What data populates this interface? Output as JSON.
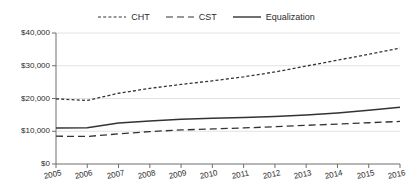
{
  "chart_data": {
    "type": "line",
    "title": "",
    "xlabel": "",
    "ylabel": "",
    "categories": [
      "2005",
      "2006",
      "2007",
      "2008",
      "2009",
      "2010",
      "2011",
      "2012",
      "2013",
      "2014",
      "2015",
      "2016"
    ],
    "ylim": [
      0,
      40000
    ],
    "ytick_values": [
      0,
      10000,
      20000,
      30000,
      40000
    ],
    "ytick_labels": [
      "$0",
      "$10,000",
      "$20,000",
      "$30,000",
      "$40,000"
    ],
    "grid": true,
    "legend_position": "top-center",
    "series": [
      {
        "name": "CHT",
        "style": "dotted",
        "color": "#333333",
        "values": [
          19900,
          19400,
          21600,
          23100,
          24300,
          25400,
          26600,
          28100,
          29900,
          31700,
          33500,
          35400
        ]
      },
      {
        "name": "CST",
        "style": "dashed",
        "color": "#333333",
        "values": [
          8500,
          8400,
          9200,
          9900,
          10400,
          10700,
          11000,
          11400,
          11800,
          12200,
          12600,
          13000
        ]
      },
      {
        "name": "Equalization",
        "style": "solid",
        "color": "#333333",
        "values": [
          11000,
          11100,
          12500,
          13100,
          13700,
          14000,
          14200,
          14500,
          15000,
          15600,
          16400,
          17300
        ]
      }
    ]
  },
  "legend": {
    "items": [
      {
        "label": "CHT",
        "swatch": "dotted-line-swatch"
      },
      {
        "label": "CST",
        "swatch": "dashed-line-swatch"
      },
      {
        "label": "Equalization",
        "swatch": "solid-line-swatch"
      }
    ]
  }
}
